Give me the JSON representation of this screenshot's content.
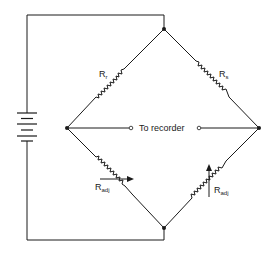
{
  "diagram": {
    "type": "Wheatstone bridge circuit",
    "components": {
      "battery": {
        "label": ""
      },
      "r_top_left": {
        "symbol": "R",
        "subscript": "r"
      },
      "r_top_right": {
        "symbol": "R",
        "subscript": "s"
      },
      "r_bottom_left": {
        "symbol": "R",
        "subscript": "adj"
      },
      "r_bottom_right": {
        "symbol": "R",
        "subscript": "adj"
      }
    },
    "output_label": "To recorder",
    "colors": {
      "line": "#1a1a1a",
      "background": "#ffffff"
    }
  }
}
